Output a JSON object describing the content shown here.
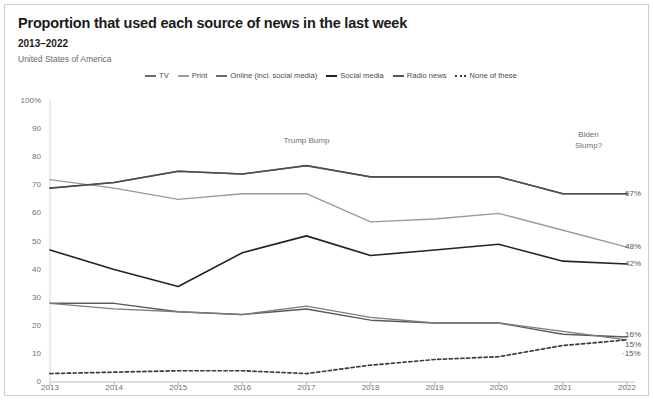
{
  "header": {
    "title": "Proportion that used each source of news in the last week",
    "subtitle": "2013–2022",
    "region": "United States of America"
  },
  "chart_data": {
    "type": "line",
    "title": "Proportion that used each source of news in the last week",
    "subtitle": "2013–2022",
    "region": "United States of America",
    "xlabel": "",
    "ylabel": "",
    "ylim": [
      0,
      100
    ],
    "yticks": [
      "0",
      "10",
      "20",
      "30",
      "40",
      "50",
      "60",
      "70",
      "80",
      "90",
      "100%"
    ],
    "ytick_values": [
      0,
      10,
      20,
      30,
      40,
      50,
      60,
      70,
      80,
      90,
      100
    ],
    "grid": false,
    "legend_position": "top",
    "categories": [
      "2013",
      "2014",
      "2015",
      "2016",
      "2017",
      "2018",
      "2019",
      "2020",
      "2021",
      "2022"
    ],
    "x": [
      2013,
      2014,
      2015,
      2016,
      2017,
      2018,
      2019,
      2020,
      2021,
      2022
    ],
    "series": [
      {
        "name": "TV",
        "color": "#6b6b6b",
        "width": 1.4,
        "dashed": false,
        "values": [
          69,
          71,
          75,
          74,
          77,
          73,
          73,
          73,
          67,
          67
        ],
        "end_label": "67%"
      },
      {
        "name": "Print",
        "color": "#9a9a9a",
        "width": 1.4,
        "dashed": false,
        "values": [
          72,
          69,
          65,
          67,
          67,
          57,
          58,
          60,
          54,
          48
        ],
        "end_label": "48%"
      },
      {
        "name": "Online (incl. social media)",
        "color": "#4d4d4d",
        "width": 1.6,
        "dashed": false,
        "values": [
          69,
          71,
          75,
          74,
          77,
          73,
          73,
          73,
          67,
          67
        ],
        "end_label": ""
      },
      {
        "name": "Social media",
        "color": "#232323",
        "width": 1.6,
        "dashed": false,
        "values": [
          47,
          40,
          34,
          46,
          52,
          45,
          47,
          49,
          43,
          42
        ],
        "end_label": "42%"
      },
      {
        "name": "Radio news",
        "color": "#5a5a5a",
        "width": 1.4,
        "dashed": false,
        "values": [
          28,
          28,
          25,
          24,
          26,
          22,
          21,
          21,
          17,
          16
        ],
        "end_label": "16%"
      },
      {
        "name": "Radio news (2)",
        "color": "#7d7d7d",
        "width": 1.3,
        "dashed": false,
        "values": [
          28,
          26,
          25,
          24,
          27,
          23,
          21,
          21,
          18,
          15
        ],
        "end_label": "15%"
      },
      {
        "name": "None of these",
        "color": "#3a3a3a",
        "width": 1.7,
        "dashed": true,
        "values": [
          3,
          3.5,
          4,
          4,
          3,
          6,
          8,
          9,
          13,
          15
        ],
        "end_label": "15%"
      }
    ],
    "annotations": [
      {
        "text": "Trump Bump",
        "x": 2017,
        "y": 88
      },
      {
        "text": "Biden\nSlump?",
        "x": 2021.4,
        "y": 90
      }
    ],
    "end_labels": [
      "67%",
      "48%",
      "42%",
      "16%",
      "15%",
      "15%"
    ]
  },
  "legend": {
    "items": [
      {
        "label": "TV",
        "color": "#6b6b6b",
        "dashed": false,
        "width": 2
      },
      {
        "label": "Print",
        "color": "#9a9a9a",
        "dashed": false,
        "width": 2
      },
      {
        "label": "Online (incl. social media)",
        "color": "#6b6b6b",
        "dashed": false,
        "width": 2
      },
      {
        "label": "Social media",
        "color": "#232323",
        "dashed": false,
        "width": 2.6
      },
      {
        "label": "Radio news",
        "color": "#5a5a5a",
        "dashed": false,
        "width": 2
      },
      {
        "label": "None of these",
        "color": "#3a3a3a",
        "dashed": true,
        "width": 2
      }
    ]
  }
}
